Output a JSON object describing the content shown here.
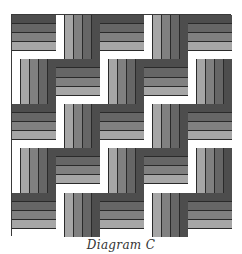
{
  "diagram": {
    "caption": "Diagram C",
    "grid": {
      "rows": 5,
      "cols": 5
    },
    "strip_colors_dark_to_light": [
      "#4d4d4d",
      "#666666",
      "#808080",
      "#a6a6a6",
      "#ffffff"
    ],
    "layout": [
      [
        "horizontal",
        "vertical",
        "horizontal",
        "vertical",
        "horizontal"
      ],
      [
        "vertical",
        "horizontal",
        "vertical",
        "horizontal",
        "vertical"
      ],
      [
        "horizontal",
        "vertical",
        "horizontal",
        "vertical",
        "horizontal"
      ],
      [
        "vertical",
        "horizontal",
        "vertical",
        "horizontal",
        "vertical"
      ],
      [
        "horizontal",
        "vertical",
        "horizontal",
        "vertical",
        "horizontal"
      ]
    ],
    "horizontal_block_order": [
      "#4d4d4d",
      "#666666",
      "#808080",
      "#a6a6a6",
      "#ffffff"
    ],
    "vertical_block_order": [
      "#ffffff",
      "#a6a6a6",
      "#808080",
      "#666666",
      "#4d4d4d"
    ]
  }
}
